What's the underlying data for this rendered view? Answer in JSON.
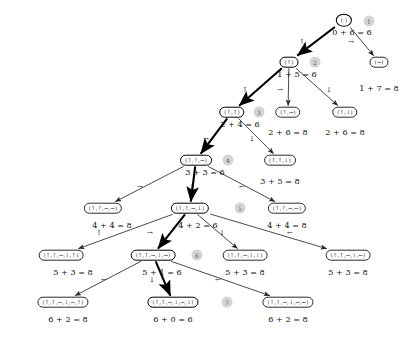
{
  "figure": {
    "kind": "search-tree",
    "background": "#ffffff",
    "node_stroke": "#2b2b2b",
    "highlight_stroke": "#000000",
    "badge_fill": "#d4d4d4",
    "badge_text": "#555555"
  },
  "chart_data": {
    "type": "diagram",
    "title": "",
    "nodes": [
      {
        "id": "n0",
        "label": "( )",
        "x": 344,
        "y": 20,
        "cost": "0 + 6 = 6",
        "cost_x": 352,
        "cost_y": 27,
        "bold": true,
        "root": true,
        "badge": "1",
        "badge_x": 369,
        "badge_y": 21
      },
      {
        "id": "n1",
        "label": "(↑)",
        "x": 289,
        "y": 62,
        "cost": "1 + 5 = 6",
        "cost_x": 297,
        "cost_y": 69,
        "bold": true,
        "badge": "2",
        "badge_x": 315,
        "badge_y": 62
      },
      {
        "id": "n2",
        "label": "(→)",
        "x": 379,
        "y": 62,
        "cost": "1 + 7 = 8",
        "cost_x": 379,
        "cost_y": 83,
        "bold": false
      },
      {
        "id": "n3",
        "label": "(↑,↑)",
        "x": 232,
        "y": 112,
        "cost": "2 + 4 = 6",
        "cost_x": 240,
        "cost_y": 119,
        "bold": true,
        "badge": "3",
        "badge_x": 259,
        "badge_y": 112
      },
      {
        "id": "n4",
        "label": "(↑,→)",
        "x": 288,
        "y": 112,
        "cost": "2 + 6 = 8",
        "cost_x": 288,
        "cost_y": 127,
        "bold": false
      },
      {
        "id": "n5",
        "label": "(↑,↓)",
        "x": 345,
        "y": 112,
        "cost": "2 + 6 = 8",
        "cost_x": 345,
        "cost_y": 127,
        "bold": false
      },
      {
        "id": "n6",
        "label": "(↑,↑,→)",
        "x": 196,
        "y": 160,
        "cost": "3 + 3 = 6",
        "cost_x": 205,
        "cost_y": 167,
        "bold": true,
        "badge": "4",
        "badge_x": 228,
        "badge_y": 160
      },
      {
        "id": "n7",
        "label": "(↑,↑,↓)",
        "x": 280,
        "y": 160,
        "cost": "3 + 5 = 8",
        "cost_x": 280,
        "cost_y": 176,
        "bold": false
      },
      {
        "id": "n8",
        "label": "(↑,↑,→,→)",
        "x": 103,
        "y": 208,
        "cost": "4 + 4 = 8",
        "cost_x": 112,
        "cost_y": 220,
        "bold": false
      },
      {
        "id": "n9",
        "label": "(↑,↑,→,↓)",
        "x": 190,
        "y": 208,
        "cost": "4 + 2 = 6",
        "cost_x": 198,
        "cost_y": 220,
        "bold": true,
        "badge": "5",
        "badge_x": 240,
        "badge_y": 208
      },
      {
        "id": "n10",
        "label": "(↑,↑,→,←)",
        "x": 287,
        "y": 208,
        "cost": "4 + 4 = 8",
        "cost_x": 287,
        "cost_y": 220,
        "bold": false
      },
      {
        "id": "n11",
        "label": "(↑,↑,→,↓,↑)",
        "x": 61,
        "y": 255,
        "cost": "5 + 3 = 8",
        "cost_x": 73,
        "cost_y": 267,
        "bold": false
      },
      {
        "id": "n12",
        "label": "(↑,↑,→,↓,→)",
        "x": 153,
        "y": 255,
        "cost": "5 + 1 = 6",
        "cost_x": 162,
        "cost_y": 267,
        "bold": true,
        "badge": "6",
        "badge_x": 197,
        "badge_y": 255
      },
      {
        "id": "n13",
        "label": "(↑,↑,→,↓,↓)",
        "x": 245,
        "y": 255,
        "cost": "5 + 3 = 8",
        "cost_x": 245,
        "cost_y": 267,
        "bold": false
      },
      {
        "id": "n14",
        "label": "(↑,↑,→,↓,←)",
        "x": 348,
        "y": 255,
        "cost": "5 + 3 = 8",
        "cost_x": 348,
        "cost_y": 267,
        "bold": false
      },
      {
        "id": "n15",
        "label": "(↑,↑,→,↓,→,↑)",
        "x": 63,
        "y": 302,
        "cost": "6 + 2 = 8",
        "cost_x": 68,
        "cost_y": 314,
        "bold": false
      },
      {
        "id": "n16",
        "label": "(↑,↑,→,↓,→,↓)",
        "x": 173,
        "y": 302,
        "cost": "6 + 0 = 6",
        "cost_x": 173,
        "cost_y": 314,
        "bold": true,
        "badge": "7",
        "badge_x": 227,
        "badge_y": 302
      },
      {
        "id": "n17",
        "label": "(↑,↑,→,↓,→,←)",
        "x": 288,
        "y": 302,
        "cost": "6 + 2 = 8",
        "cost_x": 288,
        "cost_y": 314,
        "bold": false
      }
    ],
    "edges": [
      {
        "from": "n0",
        "to": "n1",
        "bold": true,
        "label": "↑",
        "lx": 302,
        "ly": 42
      },
      {
        "from": "n0",
        "to": "n2",
        "bold": false,
        "label": "→",
        "lx": 351,
        "ly": 42
      },
      {
        "from": "n1",
        "to": "n3",
        "bold": true,
        "label": "↑",
        "lx": 245,
        "ly": 90
      },
      {
        "from": "n1",
        "to": "n4",
        "bold": false,
        "label": "→",
        "lx": 280,
        "ly": 90
      },
      {
        "from": "n1",
        "to": "n5",
        "bold": false,
        "label": "↓",
        "lx": 329,
        "ly": 90
      },
      {
        "from": "n3",
        "to": "n6",
        "bold": true,
        "label": "→",
        "lx": 206,
        "ly": 139
      },
      {
        "from": "n3",
        "to": "n7",
        "bold": false,
        "label": "↓",
        "lx": 252,
        "ly": 139
      },
      {
        "from": "n6",
        "to": "n8",
        "bold": false,
        "label": "→",
        "lx": 140,
        "ly": 187
      },
      {
        "from": "n6",
        "to": "n9",
        "bold": true,
        "label": "↓",
        "lx": 192,
        "ly": 187
      },
      {
        "from": "n6",
        "to": "n10",
        "bold": false,
        "label": "←",
        "lx": 242,
        "ly": 187
      },
      {
        "from": "n9",
        "to": "n11",
        "bold": false,
        "label": "↑",
        "lx": 99,
        "ly": 233
      },
      {
        "from": "n9",
        "to": "n12",
        "bold": true,
        "label": "→",
        "lx": 150,
        "ly": 233
      },
      {
        "from": "n9",
        "to": "n13",
        "bold": false,
        "label": "↓",
        "lx": 222,
        "ly": 233
      },
      {
        "from": "n9",
        "to": "n14",
        "bold": false,
        "label": "←",
        "lx": 290,
        "ly": 233
      },
      {
        "from": "n12",
        "to": "n15",
        "bold": false,
        "label": "←",
        "lx": 104,
        "ly": 280
      },
      {
        "from": "n12",
        "to": "n16",
        "bold": true,
        "label": "↓",
        "lx": 152,
        "ly": 280
      },
      {
        "from": "n12",
        "to": "n17",
        "bold": false,
        "label": "←",
        "lx": 218,
        "ly": 280
      }
    ]
  }
}
